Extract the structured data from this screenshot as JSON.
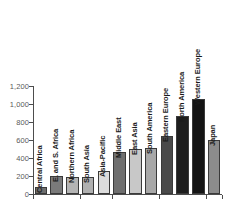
{
  "chart_data": {
    "type": "bar",
    "title": "",
    "subtitle": "",
    "xlabel": "",
    "ylabel": "",
    "categories": [
      "Central Africa",
      "E. and S. Africa",
      "Northern Africa",
      "South Asia",
      "Asia-Pacific",
      "Middle East",
      "East Asia",
      "South America",
      "Eastern Europe",
      "North America",
      "Western Europe",
      "Japan"
    ],
    "values": [
      80,
      200,
      185,
      185,
      260,
      465,
      505,
      515,
      645,
      870,
      1060,
      600
    ],
    "bar_colors": [
      "#6e6e6e",
      "#7a7a7a",
      "#b4b4b4",
      "#b0b0b0",
      "#dcdcdc",
      "#6f6f6f",
      "#c8c8c8",
      "#a8a8a8",
      "#4a4a4a",
      "#1e1e1e",
      "#141414",
      "#8c8c8c"
    ],
    "ylim": [
      0,
      1200
    ],
    "ytick_values": [
      0,
      200,
      400,
      600,
      800,
      1000,
      1200
    ],
    "ytick_labels": [
      "0",
      "200",
      "400",
      "600",
      "800",
      "1,000",
      "1,200"
    ],
    "grid": false,
    "legend": "none",
    "legend_position": "none",
    "annotations": [],
    "axis_color": "#4d4d4d",
    "tick_label_color": "#5a5a5a",
    "bar_label_color": "#1a1a1a",
    "background_color": "#ffffff"
  }
}
